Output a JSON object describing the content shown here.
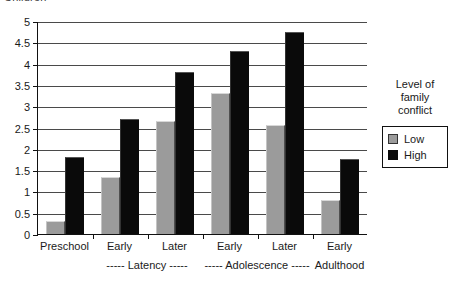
{
  "clipped_title": "Children",
  "chart_data": {
    "type": "bar",
    "title": "",
    "xlabel": "",
    "ylabel": "",
    "ylim": [
      0,
      5
    ],
    "ytick_step": 0.5,
    "yticks": [
      "5",
      "4.5",
      "4",
      "3.5",
      "3",
      "2.5",
      "2",
      "1.5",
      "1",
      "0.5",
      "0"
    ],
    "grid": true,
    "legend_position": "right",
    "categories": [
      "Preschool",
      "Early",
      "Later",
      "Early",
      "Later",
      "Early"
    ],
    "stage_labels": [
      "",
      "----- Latency -----",
      "",
      "----- Adolescence -----",
      "",
      "Adulthood"
    ],
    "series": [
      {
        "name": "Low",
        "color": "#9b9b9b",
        "values": [
          0.3,
          1.35,
          2.65,
          3.3,
          2.55,
          0.8
        ]
      },
      {
        "name": "High",
        "color": "#0a0a0a",
        "values": [
          1.8,
          2.7,
          3.8,
          4.3,
          4.75,
          1.75
        ]
      }
    ]
  },
  "legend": {
    "title_lines": [
      "Level of",
      "family",
      "conflict"
    ],
    "entries": [
      {
        "label": "Low",
        "swatch": "low-swatch-icon"
      },
      {
        "label": "High",
        "swatch": "high-swatch-icon"
      }
    ]
  }
}
